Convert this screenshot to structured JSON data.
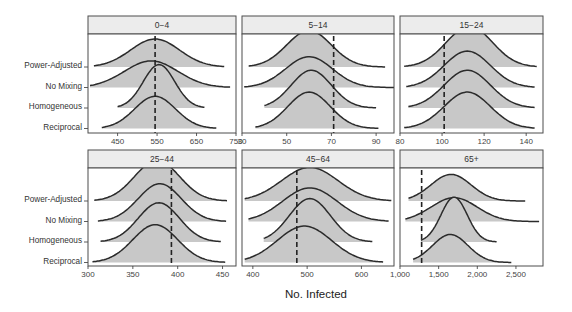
{
  "chart_data": {
    "type": "ridgeline",
    "title": "",
    "xlabel": "No. Infected",
    "ylabel": "",
    "categories": [
      "Power-Adjusted",
      "No Mixing",
      "Homogeneous",
      "Reciprocal"
    ],
    "legend": "none",
    "grid": false,
    "colors": {
      "fill": "#c8c8c8",
      "line": "#2b2b2b",
      "strip_bg": "#ececec",
      "border": "#4d4d4d",
      "ref_line": "#222222"
    },
    "panels": [
      {
        "title": "0-4",
        "xlim": [
          375,
          750
        ],
        "ticks": [
          450,
          550,
          650,
          750
        ],
        "tick_labels": [
          "450",
          "550",
          "650",
          "750"
        ],
        "observed": 545,
        "series": [
          {
            "name": "Power-Adjusted",
            "peak": 545,
            "sd": 62,
            "min": 390,
            "max": 720,
            "height": 1.0
          },
          {
            "name": "No Mixing",
            "peak": 535,
            "sd": 68,
            "min": 380,
            "max": 735,
            "height": 0.95
          },
          {
            "name": "Homogeneous",
            "peak": 555,
            "sd": 40,
            "min": 450,
            "max": 670,
            "height": 1.55
          },
          {
            "name": "Reciprocal",
            "peak": 545,
            "sd": 52,
            "min": 410,
            "max": 700,
            "height": 1.15
          }
        ]
      },
      {
        "title": "5-14",
        "xlim": [
          30,
          98
        ],
        "ticks": [
          30,
          50,
          70,
          90
        ],
        "tick_labels": [
          "30",
          "50",
          "70",
          "90"
        ],
        "observed": 71,
        "series": [
          {
            "name": "Power-Adjusted",
            "peak": 60,
            "sd": 10,
            "min": 33,
            "max": 94,
            "height": 1.3
          },
          {
            "name": "No Mixing",
            "peak": 60,
            "sd": 10.5,
            "min": 31,
            "max": 98,
            "height": 1.1
          },
          {
            "name": "Homogeneous",
            "peak": 61,
            "sd": 9,
            "min": 40,
            "max": 90,
            "height": 1.35
          },
          {
            "name": "Reciprocal",
            "peak": 60,
            "sd": 9.5,
            "min": 36,
            "max": 91,
            "height": 1.3
          }
        ]
      },
      {
        "title": "15-24",
        "xlim": [
          80,
          148
        ],
        "ticks": [
          80,
          100,
          120,
          140
        ],
        "tick_labels": [
          "80",
          "100",
          "120",
          "140"
        ],
        "observed": 101,
        "series": [
          {
            "name": "Power-Adjusted",
            "peak": 113,
            "sd": 11,
            "min": 82,
            "max": 145,
            "height": 1.45
          },
          {
            "name": "No Mixing",
            "peak": 112,
            "sd": 11,
            "min": 83,
            "max": 144,
            "height": 1.3
          },
          {
            "name": "Homogeneous",
            "peak": 112,
            "sd": 11,
            "min": 84,
            "max": 144,
            "height": 1.35
          },
          {
            "name": "Reciprocal",
            "peak": 112,
            "sd": 11,
            "min": 82,
            "max": 144,
            "height": 1.3
          }
        ]
      },
      {
        "title": "25-44",
        "xlim": [
          300,
          465
        ],
        "ticks": [
          300,
          350,
          400,
          450
        ],
        "tick_labels": [
          "300",
          "350",
          "400",
          "450"
        ],
        "observed": 393,
        "series": [
          {
            "name": "Power-Adjusted",
            "peak": 377,
            "sd": 25,
            "min": 307,
            "max": 455,
            "height": 1.45
          },
          {
            "name": "No Mixing",
            "peak": 380,
            "sd": 24,
            "min": 311,
            "max": 454,
            "height": 1.35
          },
          {
            "name": "Homogeneous",
            "peak": 379,
            "sd": 23,
            "min": 314,
            "max": 448,
            "height": 1.4
          },
          {
            "name": "Reciprocal",
            "peak": 375,
            "sd": 25,
            "min": 305,
            "max": 453,
            "height": 1.35
          }
        ]
      },
      {
        "title": "45-64",
        "xlim": [
          380,
          660
        ],
        "ticks": [
          400,
          500,
          600
        ],
        "tick_labels": [
          "400",
          "500",
          "600"
        ],
        "observed": 481,
        "series": [
          {
            "name": "Power-Adjusted",
            "peak": 505,
            "sd": 52,
            "min": 385,
            "max": 655,
            "height": 1.2
          },
          {
            "name": "No Mixing",
            "peak": 505,
            "sd": 50,
            "min": 392,
            "max": 650,
            "height": 1.2
          },
          {
            "name": "Homogeneous",
            "peak": 505,
            "sd": 38,
            "min": 420,
            "max": 620,
            "height": 1.55
          },
          {
            "name": "Reciprocal",
            "peak": 495,
            "sd": 50,
            "min": 385,
            "max": 640,
            "height": 1.3
          }
        ]
      },
      {
        "title": "65+",
        "xlim": [
          1000,
          2850
        ],
        "ticks": [
          1000,
          1500,
          2000,
          2500
        ],
        "tick_labels": [
          "1,000",
          "1,500",
          "2,000",
          "2,500"
        ],
        "observed": 1280,
        "series": [
          {
            "name": "Power-Adjusted",
            "peak": 1660,
            "sd": 260,
            "min": 1110,
            "max": 2620,
            "height": 0.95
          },
          {
            "name": "No Mixing",
            "peak": 1700,
            "sd": 300,
            "min": 1070,
            "max": 2800,
            "height": 0.85
          },
          {
            "name": "Homogeneous",
            "peak": 1700,
            "sd": 170,
            "min": 1270,
            "max": 2250,
            "height": 1.6
          },
          {
            "name": "Reciprocal",
            "peak": 1650,
            "sd": 230,
            "min": 1170,
            "max": 2440,
            "height": 1.0
          }
        ]
      }
    ]
  }
}
